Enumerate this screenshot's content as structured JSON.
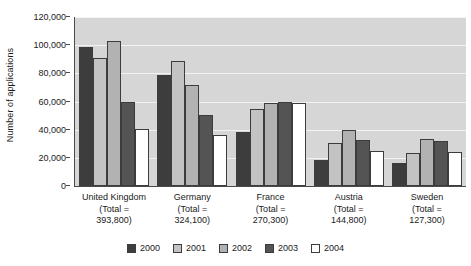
{
  "chart_data": {
    "type": "bar",
    "title": "",
    "xlabel": "",
    "ylabel": "Number of applications",
    "ylim": [
      0,
      120000
    ],
    "ytick_labels": [
      "120,000",
      "100,000",
      "80,000",
      "60,000",
      "40,000",
      "20,000",
      "0"
    ],
    "ytick_values": [
      120000,
      100000,
      80000,
      60000,
      40000,
      20000,
      0
    ],
    "grid": true,
    "legend_position": "bottom",
    "categories": [
      "United Kingdom",
      "Germany",
      "France",
      "Austria",
      "Sweden"
    ],
    "category_totals": [
      "393,800",
      "324,100",
      "270,300",
      "144,800",
      "127,300"
    ],
    "category_labels": [
      {
        "name": "United Kingdom",
        "line2": "(Total =",
        "line3": "393,800)"
      },
      {
        "name": "Germany",
        "line2": "(Total =",
        "line3": "324,100)"
      },
      {
        "name": "France",
        "line2": "(Total =",
        "line3": "270,300)"
      },
      {
        "name": "Austria",
        "line2": "(Total =",
        "line3": "144,800)"
      },
      {
        "name": "Sweden",
        "line2": "(Total =",
        "line3": "127,300)"
      }
    ],
    "series": [
      {
        "name": "2000",
        "color": "#3d3d3d",
        "values": [
          99000,
          78500,
          38700,
          18800,
          16500
        ]
      },
      {
        "name": "2001",
        "color": "#c3c3c3",
        "values": [
          91200,
          88800,
          54500,
          30600,
          23700
        ]
      },
      {
        "name": "2002",
        "color": "#b2b2b2",
        "values": [
          103300,
          71500,
          58700,
          40000,
          33400
        ]
      },
      {
        "name": "2003",
        "color": "#545454",
        "values": [
          59700,
          50600,
          59500,
          32600,
          32000
        ]
      },
      {
        "name": "2004",
        "color": "#ffffff",
        "values": [
          40700,
          36000,
          58800,
          24700,
          23900
        ]
      }
    ]
  },
  "legend": {
    "items": [
      {
        "label": "2000"
      },
      {
        "label": "2001"
      },
      {
        "label": "2002"
      },
      {
        "label": "2003"
      },
      {
        "label": "2004"
      }
    ]
  }
}
